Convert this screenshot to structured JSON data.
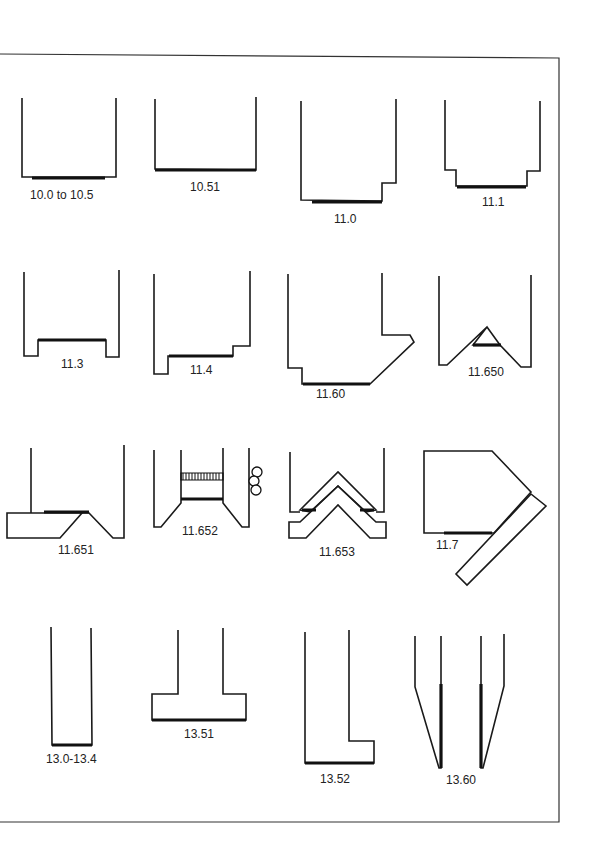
{
  "figure": {
    "rows": [
      {
        "items": [
          {
            "id": "fig-10-0",
            "label": "10.0 to 10.5"
          },
          {
            "id": "fig-10-51",
            "label": "10.51"
          },
          {
            "id": "fig-11-0",
            "label": "11.0"
          },
          {
            "id": "fig-11-1",
            "label": "11.1"
          }
        ]
      },
      {
        "items": [
          {
            "id": "fig-11-3",
            "label": "11.3"
          },
          {
            "id": "fig-11-4",
            "label": "11.4"
          },
          {
            "id": "fig-11-60",
            "label": "11.60"
          },
          {
            "id": "fig-11-650",
            "label": "11.650"
          }
        ]
      },
      {
        "items": [
          {
            "id": "fig-11-651",
            "label": "11.651"
          },
          {
            "id": "fig-11-652",
            "label": "11.652"
          },
          {
            "id": "fig-11-653",
            "label": "11.653"
          },
          {
            "id": "fig-11-7",
            "label": "11.7"
          }
        ]
      },
      {
        "items": [
          {
            "id": "fig-13-0",
            "label": "13.0-13.4"
          },
          {
            "id": "fig-13-51",
            "label": "13.51"
          },
          {
            "id": "fig-13-52",
            "label": "13.52"
          },
          {
            "id": "fig-13-60",
            "label": "13.60"
          }
        ]
      }
    ]
  }
}
